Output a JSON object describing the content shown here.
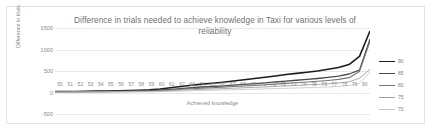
{
  "chart_data": {
    "type": "line",
    "title": "Difference in trials needed to achieve knowledge in Taxi for various levels of reliability",
    "xlabel": "Achieved knowledge",
    "ylabel": "Difference in trials",
    "xlim": [
      50,
      80
    ],
    "ylim": [
      -500,
      1500
    ],
    "yticks": [
      1500,
      1000,
      500,
      0,
      -500
    ],
    "grid": true,
    "legend_position": "right",
    "x": [
      50,
      51,
      52,
      53,
      54,
      55,
      56,
      57,
      58,
      59,
      60,
      61,
      62,
      63,
      64,
      65,
      66,
      67,
      68,
      69,
      70,
      71,
      72,
      73,
      74,
      75,
      76,
      77,
      78,
      79,
      80
    ],
    "series": [
      {
        "name": "90",
        "color": "#1c1c1c",
        "width": 1.6,
        "values": [
          20,
          22,
          25,
          28,
          32,
          36,
          41,
          47,
          54,
          62,
          80,
          110,
          140,
          168,
          195,
          215,
          240,
          268,
          296,
          325,
          355,
          385,
          420,
          445,
          470,
          500,
          540,
          580,
          650,
          840,
          1430
        ]
      },
      {
        "name": "85",
        "color": "#4a4a4a",
        "width": 1.3,
        "values": [
          15,
          16,
          18,
          20,
          23,
          26,
          30,
          34,
          39,
          45,
          55,
          72,
          92,
          110,
          128,
          140,
          155,
          172,
          190,
          208,
          226,
          244,
          265,
          285,
          305,
          325,
          350,
          380,
          430,
          520,
          1240
        ]
      },
      {
        "name": "80",
        "color": "#777777",
        "width": 1.1,
        "values": [
          12,
          13,
          14,
          16,
          18,
          21,
          24,
          27,
          31,
          36,
          44,
          58,
          74,
          88,
          102,
          112,
          124,
          138,
          152,
          166,
          180,
          195,
          212,
          228,
          244,
          260,
          280,
          305,
          345,
          490,
          1190
        ]
      },
      {
        "name": "75",
        "color": "#a0a0a0",
        "width": 0.9,
        "values": [
          8,
          9,
          10,
          11,
          13,
          15,
          17,
          19,
          22,
          26,
          32,
          42,
          54,
          64,
          74,
          82,
          90,
          100,
          110,
          120,
          130,
          141,
          153,
          165,
          177,
          188,
          203,
          221,
          250,
          330,
          540
        ]
      },
      {
        "name": "70",
        "color": "#c4c4c4",
        "width": 0.8,
        "values": [
          5,
          5,
          6,
          7,
          8,
          9,
          11,
          12,
          14,
          16,
          20,
          27,
          34,
          41,
          47,
          52,
          58,
          64,
          70,
          77,
          83,
          90,
          98,
          105,
          113,
          120,
          130,
          141,
          160,
          215,
          480
        ]
      }
    ]
  },
  "legend": {
    "items": [
      {
        "label": "90"
      },
      {
        "label": "85"
      },
      {
        "label": "80"
      },
      {
        "label": "75"
      },
      {
        "label": "70"
      }
    ]
  }
}
